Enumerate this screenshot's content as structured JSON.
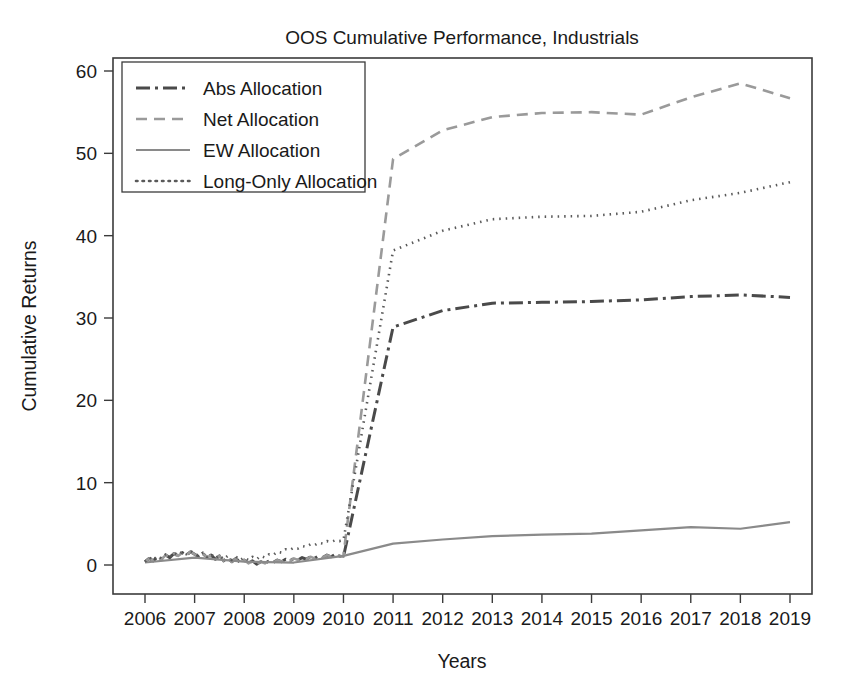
{
  "chart_data": {
    "type": "line",
    "title": "OOS Cumulative Performance, Industrials",
    "xlabel": "Years",
    "ylabel": "Cumulative Returns",
    "xlim": [
      2005.6,
      2019.4
    ],
    "ylim": [
      -2.5,
      62.0
    ],
    "grid": false,
    "legend_position": "upper-left",
    "xticks": [
      "2006",
      "2007",
      "2008",
      "2009",
      "2010",
      "2011",
      "2012",
      "2013",
      "2014",
      "2015",
      "2016",
      "2017",
      "2018",
      "2019"
    ],
    "yticks": [
      "0",
      "10",
      "20",
      "30",
      "40",
      "50",
      "60"
    ],
    "x": [
      2006,
      2007,
      2008,
      2009,
      2010,
      2011,
      2012,
      2013,
      2014,
      2015,
      2016,
      2017,
      2018,
      2019
    ],
    "series": [
      {
        "name": "Abs Allocation",
        "style": "dashdot",
        "color": "#4a4a4a",
        "width": 3.0,
        "dasharray": "14,5,3,5",
        "values": [
          0.4,
          1.3,
          0.6,
          0.5,
          1.0,
          28.9,
          30.9,
          31.8,
          31.9,
          32.0,
          32.2,
          32.6,
          32.8,
          32.5
        ]
      },
      {
        "name": "Net Allocation",
        "style": "dashed",
        "color": "#9a9a9a",
        "width": 2.6,
        "dasharray": "11,7",
        "values": [
          0.4,
          1.3,
          0.6,
          0.5,
          1.2,
          49.3,
          52.8,
          54.4,
          54.9,
          55.0,
          54.7,
          56.8,
          58.5,
          56.7
        ]
      },
      {
        "name": "EW Allocation",
        "style": "solid",
        "color": "#8a8a8a",
        "width": 2.2,
        "dasharray": "none",
        "values": [
          0.3,
          0.9,
          0.4,
          0.3,
          1.1,
          2.6,
          3.1,
          3.5,
          3.7,
          3.8,
          4.2,
          4.6,
          4.4,
          5.2
        ]
      },
      {
        "name": "Long-Only Allocation",
        "style": "dotted",
        "color": "#5a5a5a",
        "width": 2.6,
        "dasharray": "1.5,5",
        "values": [
          0.4,
          1.4,
          0.7,
          1.2,
          3.0,
          38.2,
          40.6,
          42.0,
          42.3,
          42.4,
          42.9,
          44.3,
          45.2,
          46.5
        ]
      }
    ],
    "early_noise": {
      "description": "High-frequency monthly wiggle visible from 2006 through early 2010 before the regime jump",
      "abs_monthly": [
        0.4,
        0.8,
        0.5,
        1.0,
        0.7,
        1.2,
        0.9,
        1.4,
        1.1,
        1.5,
        1.2,
        1.6,
        1.3,
        1.0,
        1.4,
        0.9,
        1.2,
        0.7,
        1.1,
        0.5,
        0.9,
        0.4,
        0.8,
        0.3,
        0.6,
        0.2,
        0.5,
        0.1,
        0.4,
        0.2,
        0.5,
        0.3,
        0.6,
        0.4,
        0.7,
        0.5,
        0.8,
        0.6,
        0.9,
        0.7,
        1.0,
        0.8,
        1.1,
        0.9,
        1.2,
        1.0,
        1.3,
        1.1,
        1.0
      ],
      "longonly_monthly": [
        0.4,
        0.9,
        0.6,
        1.1,
        0.8,
        1.3,
        1.0,
        1.5,
        1.2,
        1.6,
        1.3,
        1.7,
        1.4,
        1.1,
        1.5,
        1.0,
        1.3,
        0.8,
        1.2,
        0.7,
        1.1,
        0.6,
        1.0,
        0.6,
        0.9,
        0.6,
        1.0,
        0.7,
        1.1,
        0.9,
        1.3,
        1.2,
        1.6,
        1.5,
        1.9,
        1.8,
        2.1,
        2.0,
        2.3,
        2.2,
        2.5,
        2.4,
        2.7,
        2.6,
        2.9,
        2.8,
        3.0,
        2.9,
        3.0
      ]
    }
  },
  "figure": {
    "title": "OOS Cumulative Performance, Industrials",
    "xlabel": "Years",
    "ylabel": "Cumulative Returns"
  },
  "legend": {
    "items": [
      {
        "label": "Abs Allocation"
      },
      {
        "label": "Net Allocation"
      },
      {
        "label": "EW Allocation"
      },
      {
        "label": "Long-Only Allocation"
      }
    ]
  }
}
